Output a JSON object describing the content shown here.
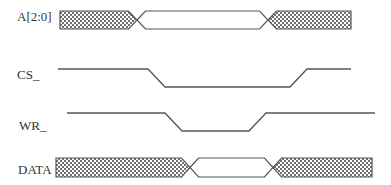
{
  "diagram": {
    "type": "timing-diagram",
    "stroke_color": "#555555",
    "hatch_color": "#666666",
    "signals": [
      {
        "name": "A[2:0]",
        "kind": "bus",
        "label_x": 17,
        "label_y": 10,
        "segments": [
          {
            "state": "invalid",
            "x_start": 60,
            "x_end": 137
          },
          {
            "state": "valid",
            "x_start": 137,
            "x_end": 268
          },
          {
            "state": "invalid",
            "x_start": 268,
            "x_end": 351
          }
        ],
        "transition_width": 17,
        "y_top": 11,
        "y_bottom": 29
      },
      {
        "name": "CS_",
        "kind": "level",
        "label_x": 17,
        "label_y": 68,
        "points": [
          [
            58,
            69
          ],
          [
            148,
            69
          ],
          [
            165,
            87
          ],
          [
            290,
            87
          ],
          [
            307,
            69
          ],
          [
            351,
            69
          ]
        ]
      },
      {
        "name": "WR_",
        "kind": "level",
        "label_x": 19,
        "label_y": 119,
        "points": [
          [
            67,
            113
          ],
          [
            165,
            113
          ],
          [
            182,
            131
          ],
          [
            249,
            131
          ],
          [
            266,
            113
          ],
          [
            375,
            113
          ]
        ]
      },
      {
        "name": "DATA",
        "kind": "bus",
        "label_x": 18,
        "label_y": 163,
        "segments": [
          {
            "state": "invalid",
            "x_start": 56,
            "x_end": 190
          },
          {
            "state": "valid",
            "x_start": 190,
            "x_end": 273
          },
          {
            "state": "invalid",
            "x_start": 273,
            "x_end": 372
          }
        ],
        "transition_width": 17,
        "y_top": 158,
        "y_bottom": 177
      }
    ]
  }
}
